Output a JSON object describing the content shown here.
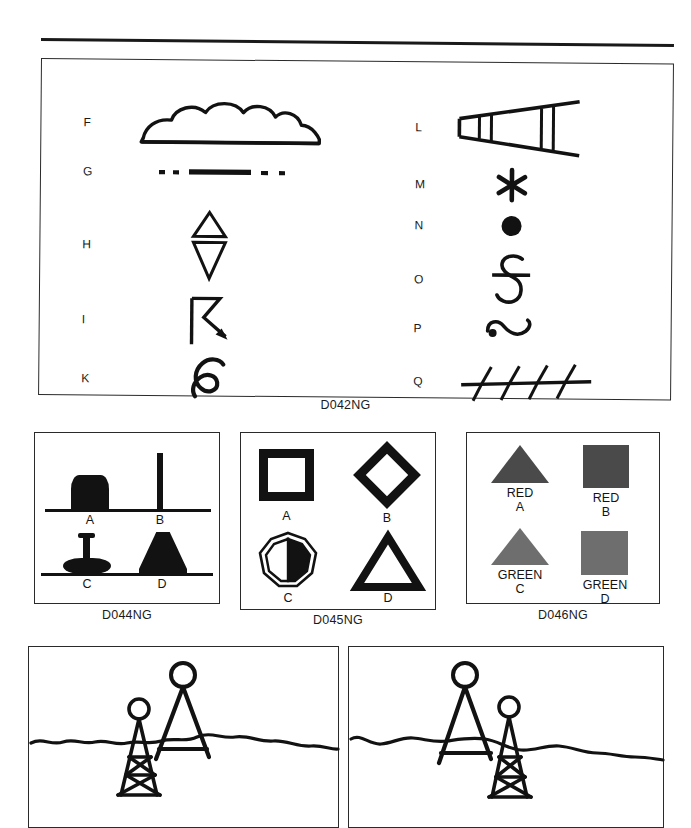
{
  "sheet": {
    "title": "Nautical chart symbol reference plate",
    "rule_present": true
  },
  "plates": [
    {
      "id": "D042NG",
      "caption": "D042NG",
      "kind": "symbol-key",
      "columns": [
        {
          "side": "left",
          "entries": [
            {
              "letter": "F",
              "symbol": "cloud-outline-shape"
            },
            {
              "letter": "G",
              "symbol": "dash-dot-line"
            },
            {
              "letter": "H",
              "symbol": "double-triangle-topmark"
            },
            {
              "letter": "I",
              "symbol": "zigzag-arrow"
            },
            {
              "letter": "K",
              "symbol": "reversed-s-glyph"
            }
          ]
        },
        {
          "side": "right",
          "entries": [
            {
              "letter": "L",
              "symbol": "tapered-wedge-with-bars"
            },
            {
              "letter": "M",
              "symbol": "asterisk-star"
            },
            {
              "letter": "N",
              "symbol": "filled-circle-dot"
            },
            {
              "letter": "O",
              "symbol": "struck-through-s"
            },
            {
              "letter": "P",
              "symbol": "wave-with-dot"
            },
            {
              "letter": "Q",
              "symbol": "barbed-line"
            }
          ]
        }
      ]
    },
    {
      "id": "D044NG",
      "caption": "D044NG",
      "kind": "buoy-silhouettes",
      "items": [
        {
          "label": "A",
          "shape": "can-buoy"
        },
        {
          "label": "B",
          "shape": "spar-buoy"
        },
        {
          "label": "C",
          "shape": "disc-buoy-with-mast"
        },
        {
          "label": "D",
          "shape": "conical-nun-buoy"
        }
      ]
    },
    {
      "id": "D045NG",
      "caption": "D045NG",
      "kind": "daymark-outlines",
      "items": [
        {
          "label": "A",
          "shape": "square-outline"
        },
        {
          "label": "B",
          "shape": "diamond-outline"
        },
        {
          "label": "C",
          "shape": "octagon-half-filled"
        },
        {
          "label": "D",
          "shape": "triangle-outline"
        }
      ]
    },
    {
      "id": "D046NG",
      "caption": "D046NG",
      "kind": "coloured-daymarks",
      "items": [
        {
          "label": "A",
          "colour_text": "RED",
          "shape": "triangle",
          "fill": "#4a4a4a"
        },
        {
          "label": "B",
          "colour_text": "RED",
          "shape": "square",
          "fill": "#4a4a4a"
        },
        {
          "label": "C",
          "colour_text": "GREEN",
          "shape": "triangle",
          "fill": "#6e6e6e"
        },
        {
          "label": "D",
          "colour_text": "GREEN",
          "shape": "square",
          "fill": "#6e6e6e"
        }
      ]
    },
    {
      "id": "range-left",
      "kind": "range-marker-scene",
      "caption": "",
      "description": "two lattice towers with round topmarks behind a wavy waterline, tall tower on the right"
    },
    {
      "id": "range-right",
      "kind": "range-marker-scene",
      "caption": "",
      "description": "two lattice towers with round topmarks behind a wavy waterline, tall tower on the left"
    }
  ],
  "colors": {
    "ink": "#121212",
    "frame": "#2a2a2a",
    "red_swatch": "#4a4a4a",
    "green_swatch": "#6e6e6e",
    "paper": "#ffffff"
  }
}
